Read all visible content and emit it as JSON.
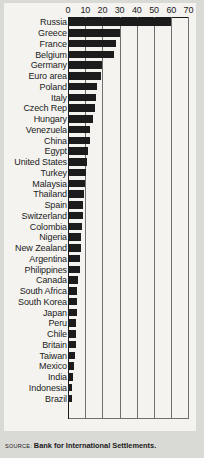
{
  "chart_data": {
    "type": "bar",
    "orientation": "horizontal",
    "title": "",
    "subtitle": "",
    "xlabel": "",
    "ylabel": "",
    "xlim": [
      0,
      70
    ],
    "ylim": null,
    "grid": true,
    "gridlines": "vertical",
    "legend": null,
    "legend_position": "none",
    "source": "Bank for International Settlements.",
    "source_prefix": "SOURCE:",
    "tick_labels": [
      "0",
      "10",
      "20",
      "30",
      "40",
      "50",
      "60",
      "70"
    ],
    "ticks": [
      0,
      10,
      20,
      30,
      40,
      50,
      60,
      70
    ],
    "bar_color": "#1c1c1c",
    "categories": [
      "Russia",
      "Greece",
      "France",
      "Belgium",
      "Germany",
      "Euro area",
      "Poland",
      "Italy",
      "Czech Rep",
      "Hungary",
      "Venezuela",
      "China",
      "Egypt",
      "United States",
      "Turkey",
      "Malaysia",
      "Thailand",
      "Spain",
      "Switzerland",
      "Colombia",
      "Nigeria",
      "New Zealand",
      "Argentina",
      "Philippines",
      "Canada",
      "South Africa",
      "South Korea",
      "Japan",
      "Peru",
      "Chile",
      "Britain",
      "Taiwan",
      "Mexico",
      "India",
      "Indonesia",
      "Brazil"
    ],
    "values": [
      60,
      30,
      28,
      27,
      20,
      19,
      17,
      16,
      15.5,
      14.5,
      13,
      12.5,
      11.5,
      11,
      10.5,
      10,
      9.5,
      9,
      8.5,
      8,
      7.5,
      7.5,
      7,
      7,
      6,
      5.5,
      5.5,
      5,
      4.5,
      4.5,
      4.5,
      4,
      3.5,
      3,
      2.5,
      2.5
    ]
  }
}
